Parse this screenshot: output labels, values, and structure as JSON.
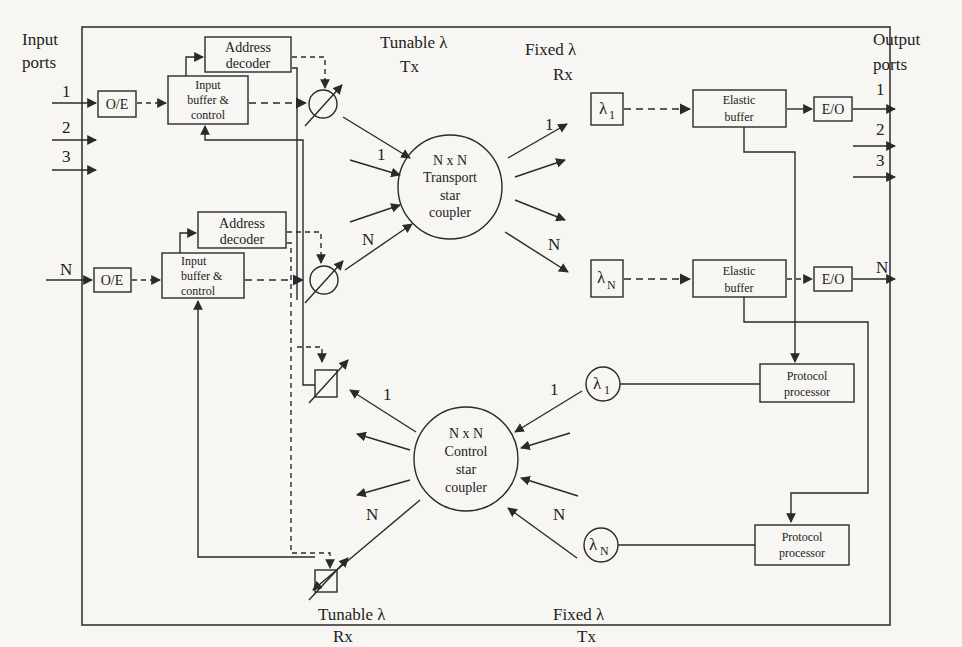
{
  "diagram": {
    "type": "block-diagram",
    "colors": {
      "background": "#f7f6f3",
      "ink": "#2a2a2a"
    },
    "labels": {
      "input_ports_line1": "Input",
      "input_ports_line2": "ports",
      "output_ports_line1": "Output",
      "output_ports_line2": "ports",
      "in_port_1": "1",
      "in_port_2": "2",
      "in_port_3": "3",
      "in_port_n": "N",
      "out_port_1": "1",
      "out_port_2": "2",
      "out_port_3": "3",
      "out_port_n": "N",
      "tunable_tx_line1": "Tunable  λ",
      "tunable_tx_line2": "Tx",
      "fixed_rx_line1": "Fixed  λ",
      "fixed_rx_line2": "Rx",
      "tunable_rx_line1": "Tunable  λ",
      "tunable_rx_line2": "Rx",
      "fixed_tx_line1": "Fixed  λ",
      "fixed_tx_line2": "Tx",
      "tx_in_1": "1",
      "tx_in_n": "N",
      "tx_out_1": "1",
      "tx_out_n": "N",
      "ctrl_out_1": "1",
      "ctrl_out_n": "N",
      "ctrl_in_1": "1",
      "ctrl_in_n": "N"
    },
    "blocks": {
      "oe_1": "O/E",
      "oe_n": "O/E",
      "address_decoder_1_line1": "Address",
      "address_decoder_1_line2": "decoder",
      "address_decoder_n_line1": "Address",
      "address_decoder_n_line2": "decoder",
      "input_buffer_1_line1": "Input",
      "input_buffer_1_line2": "buffer &",
      "input_buffer_1_line3": "control",
      "input_buffer_n_line1": "Input",
      "input_buffer_n_line2": "buffer &",
      "input_buffer_n_line3": "control",
      "transport_coupler_line1": "N x N",
      "transport_coupler_line2": "Transport",
      "transport_coupler_line3": "star",
      "transport_coupler_line4": "coupler",
      "control_coupler_line1": "N x N",
      "control_coupler_line2": "Control",
      "control_coupler_line3": "star",
      "control_coupler_line4": "coupler",
      "fixed_rx_1": "λ",
      "fixed_rx_1_sub": "1",
      "fixed_rx_n": "λ",
      "fixed_rx_n_sub": "N",
      "elastic_buffer_1_line1": "Elastic",
      "elastic_buffer_1_line2": "buffer",
      "elastic_buffer_n_line1": "Elastic",
      "elastic_buffer_n_line2": "buffer",
      "eo_1": "E/O",
      "eo_n": "E/O",
      "fixed_tx_1": "λ",
      "fixed_tx_1_sub": "1",
      "fixed_tx_n": "λ",
      "fixed_tx_n_sub": "N",
      "protocol_processor_1_line1": "Protocol",
      "protocol_processor_1_line2": "processor",
      "protocol_processor_n_line1": "Protocol",
      "protocol_processor_n_line2": "processor"
    }
  }
}
